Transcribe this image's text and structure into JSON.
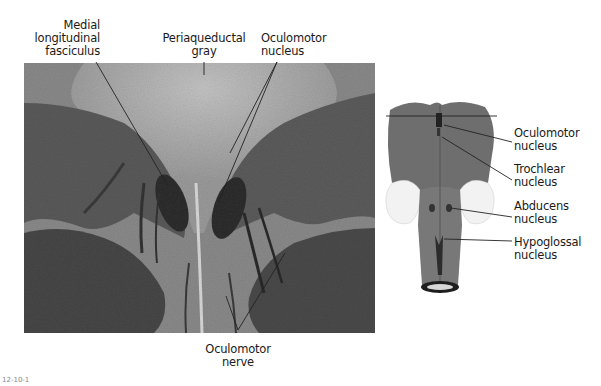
{
  "figure": {
    "type": "labeled histology diagram",
    "figure_number": "12-10-1",
    "colors": {
      "background": "#ffffff",
      "tissue_light": "#b8b8b8",
      "tissue_dark": "#3a3a3a",
      "leader_line": "#222222",
      "brainstem": "#6e6e6e"
    }
  },
  "micrograph": {
    "labels": [
      {
        "id": "medial-longitudinal-fasciculus",
        "lines": [
          "Medial",
          "longitudinal",
          "fasciculus"
        ]
      },
      {
        "id": "periaqueductal-gray",
        "lines": [
          "Periaqueductal",
          "gray"
        ]
      },
      {
        "id": "oculomotor-nucleus",
        "lines": [
          "Oculomotor",
          "nucleus"
        ]
      },
      {
        "id": "oculomotor-nerve",
        "lines": [
          "Oculomotor",
          "nerve"
        ]
      }
    ]
  },
  "brainstem_diagram": {
    "labels": [
      {
        "id": "oculomotor-nucleus",
        "lines": [
          "Oculomotor",
          "nucleus"
        ]
      },
      {
        "id": "trochlear-nucleus",
        "lines": [
          "Trochlear",
          "nucleus"
        ]
      },
      {
        "id": "abducens-nucleus",
        "lines": [
          "Abducens",
          "nucleus"
        ]
      },
      {
        "id": "hypoglossal-nucleus",
        "lines": [
          "Hypoglossal",
          "nucleus"
        ]
      }
    ]
  }
}
